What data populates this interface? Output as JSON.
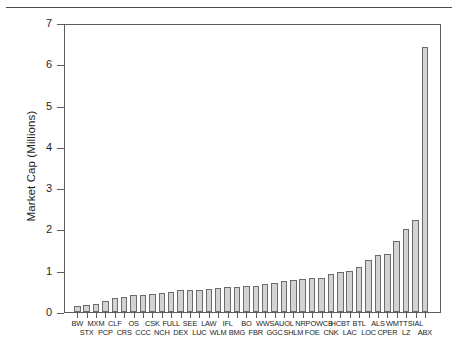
{
  "page": {
    "divider": "horizontal-rule"
  },
  "chart_data": {
    "type": "bar",
    "title": "",
    "xlabel": "",
    "ylabel": "Market Cap (Millions)",
    "ylim": [
      0,
      7
    ],
    "yticks": [
      0,
      1,
      2,
      3,
      4,
      5,
      6,
      7
    ],
    "ytick_labels": [
      "0",
      "1",
      "2",
      "3",
      "4",
      "5",
      "6",
      "7"
    ],
    "grid": false,
    "legend": null,
    "bar_fill_color": "#d3d3d3",
    "bar_edge_color": "#6b6b6b",
    "categories": [
      "BW",
      "STX",
      "MXM",
      "PCP",
      "CLF",
      "CRS",
      "OS",
      "CCC",
      "CSK",
      "NCH",
      "FULL",
      "DEX",
      "SEE",
      "LUC",
      "LAW",
      "WLM",
      "IFL",
      "BMG",
      "BO",
      "FBR",
      "WWS",
      "GGC",
      "AUOL",
      "SHLM",
      "NRP",
      "FOE",
      "OWCB",
      "CNK",
      "HCBT",
      "LAC",
      "BTL",
      "LOC",
      "ALS",
      "CPER",
      "WMTT",
      "LZ",
      "SIAL",
      "ABX"
    ],
    "values": [
      0.17,
      0.2,
      0.23,
      0.3,
      0.36,
      0.39,
      0.43,
      0.44,
      0.45,
      0.48,
      0.52,
      0.55,
      0.55,
      0.55,
      0.59,
      0.6,
      0.63,
      0.64,
      0.65,
      0.66,
      0.7,
      0.73,
      0.77,
      0.8,
      0.82,
      0.84,
      0.85,
      0.95,
      1.0,
      1.01,
      1.11,
      1.28,
      1.4,
      1.42,
      1.75,
      2.03,
      2.25,
      6.45
    ],
    "x_labels_row_top": [
      "BW",
      "MXM",
      "CLF",
      "OS",
      "CSK",
      "FULL",
      "SEE",
      "LAW",
      "IFL",
      "BO",
      "WWS",
      "AUOL",
      "NRP",
      "OWCB",
      "HCBT",
      "BTL",
      "ALS",
      "WMTT",
      "SIAL"
    ],
    "x_labels_row_bottom": [
      "STX",
      "PCP",
      "CRS",
      "CCC",
      "NCH",
      "DEX",
      "LUC",
      "WLM",
      "BMG",
      "FBR",
      "GGC",
      "SHLM",
      "FOE",
      "CNK",
      "LAC",
      "LOC",
      "CPER",
      "LZ",
      "ABX"
    ]
  }
}
